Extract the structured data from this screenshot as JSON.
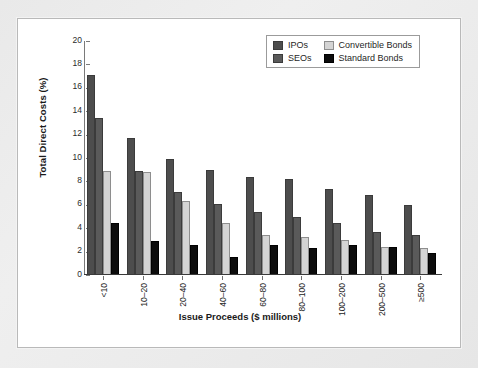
{
  "chart_data": {
    "type": "bar",
    "title": "",
    "xlabel": "Issue Proceeds ($ millions)",
    "ylabel": "Total Direct Costs (%)",
    "ylim": [
      0,
      20
    ],
    "yticks": [
      0,
      2,
      4,
      6,
      8,
      10,
      12,
      14,
      16,
      18,
      20
    ],
    "grid": false,
    "legend_position": "top-right",
    "categories": [
      "<10",
      "10–20",
      "20–40",
      "40–60",
      "60–80",
      "80–100",
      "100–200",
      "200–500",
      "≥500"
    ],
    "series": [
      {
        "name": "IPOs",
        "color": "#4d4d4d",
        "values": [
          17.0,
          11.6,
          9.8,
          8.9,
          8.3,
          8.1,
          7.3,
          6.75,
          5.9
        ]
      },
      {
        "name": "SEOs",
        "color": "#5a5a5a",
        "values": [
          13.3,
          8.8,
          7.0,
          6.0,
          5.3,
          4.85,
          4.35,
          3.6,
          3.35
        ]
      },
      {
        "name": "Convertible Bonds",
        "color": "#d4d4d4",
        "values": [
          8.8,
          8.7,
          6.2,
          4.4,
          3.3,
          3.15,
          2.9,
          2.3,
          2.25
        ]
      },
      {
        "name": "Standard Bonds",
        "color": "#0c0c0c",
        "values": [
          4.4,
          2.8,
          2.5,
          1.45,
          2.5,
          2.25,
          2.45,
          2.35,
          1.8
        ]
      }
    ]
  },
  "axes": {
    "y_title": "Total Direct Costs (%)",
    "x_title": "Issue Proceeds ($ millions)",
    "y_tick_labels": [
      "20",
      "18",
      "16",
      "14",
      "12",
      "10",
      "8",
      "6",
      "4",
      "2",
      "0"
    ],
    "x_tick_labels": [
      "<10",
      "10–20",
      "20–40",
      "40–60",
      "60–80",
      "80–100",
      "100–200",
      "200–500",
      "≥500"
    ]
  },
  "legend": {
    "entries": [
      {
        "label": "IPOs",
        "color": "#4d4d4d"
      },
      {
        "label": "Convertible Bonds",
        "color": "#d4d4d4"
      },
      {
        "label": "SEOs",
        "color": "#5a5a5a"
      },
      {
        "label": "Standard Bonds",
        "color": "#0c0c0c"
      }
    ]
  }
}
